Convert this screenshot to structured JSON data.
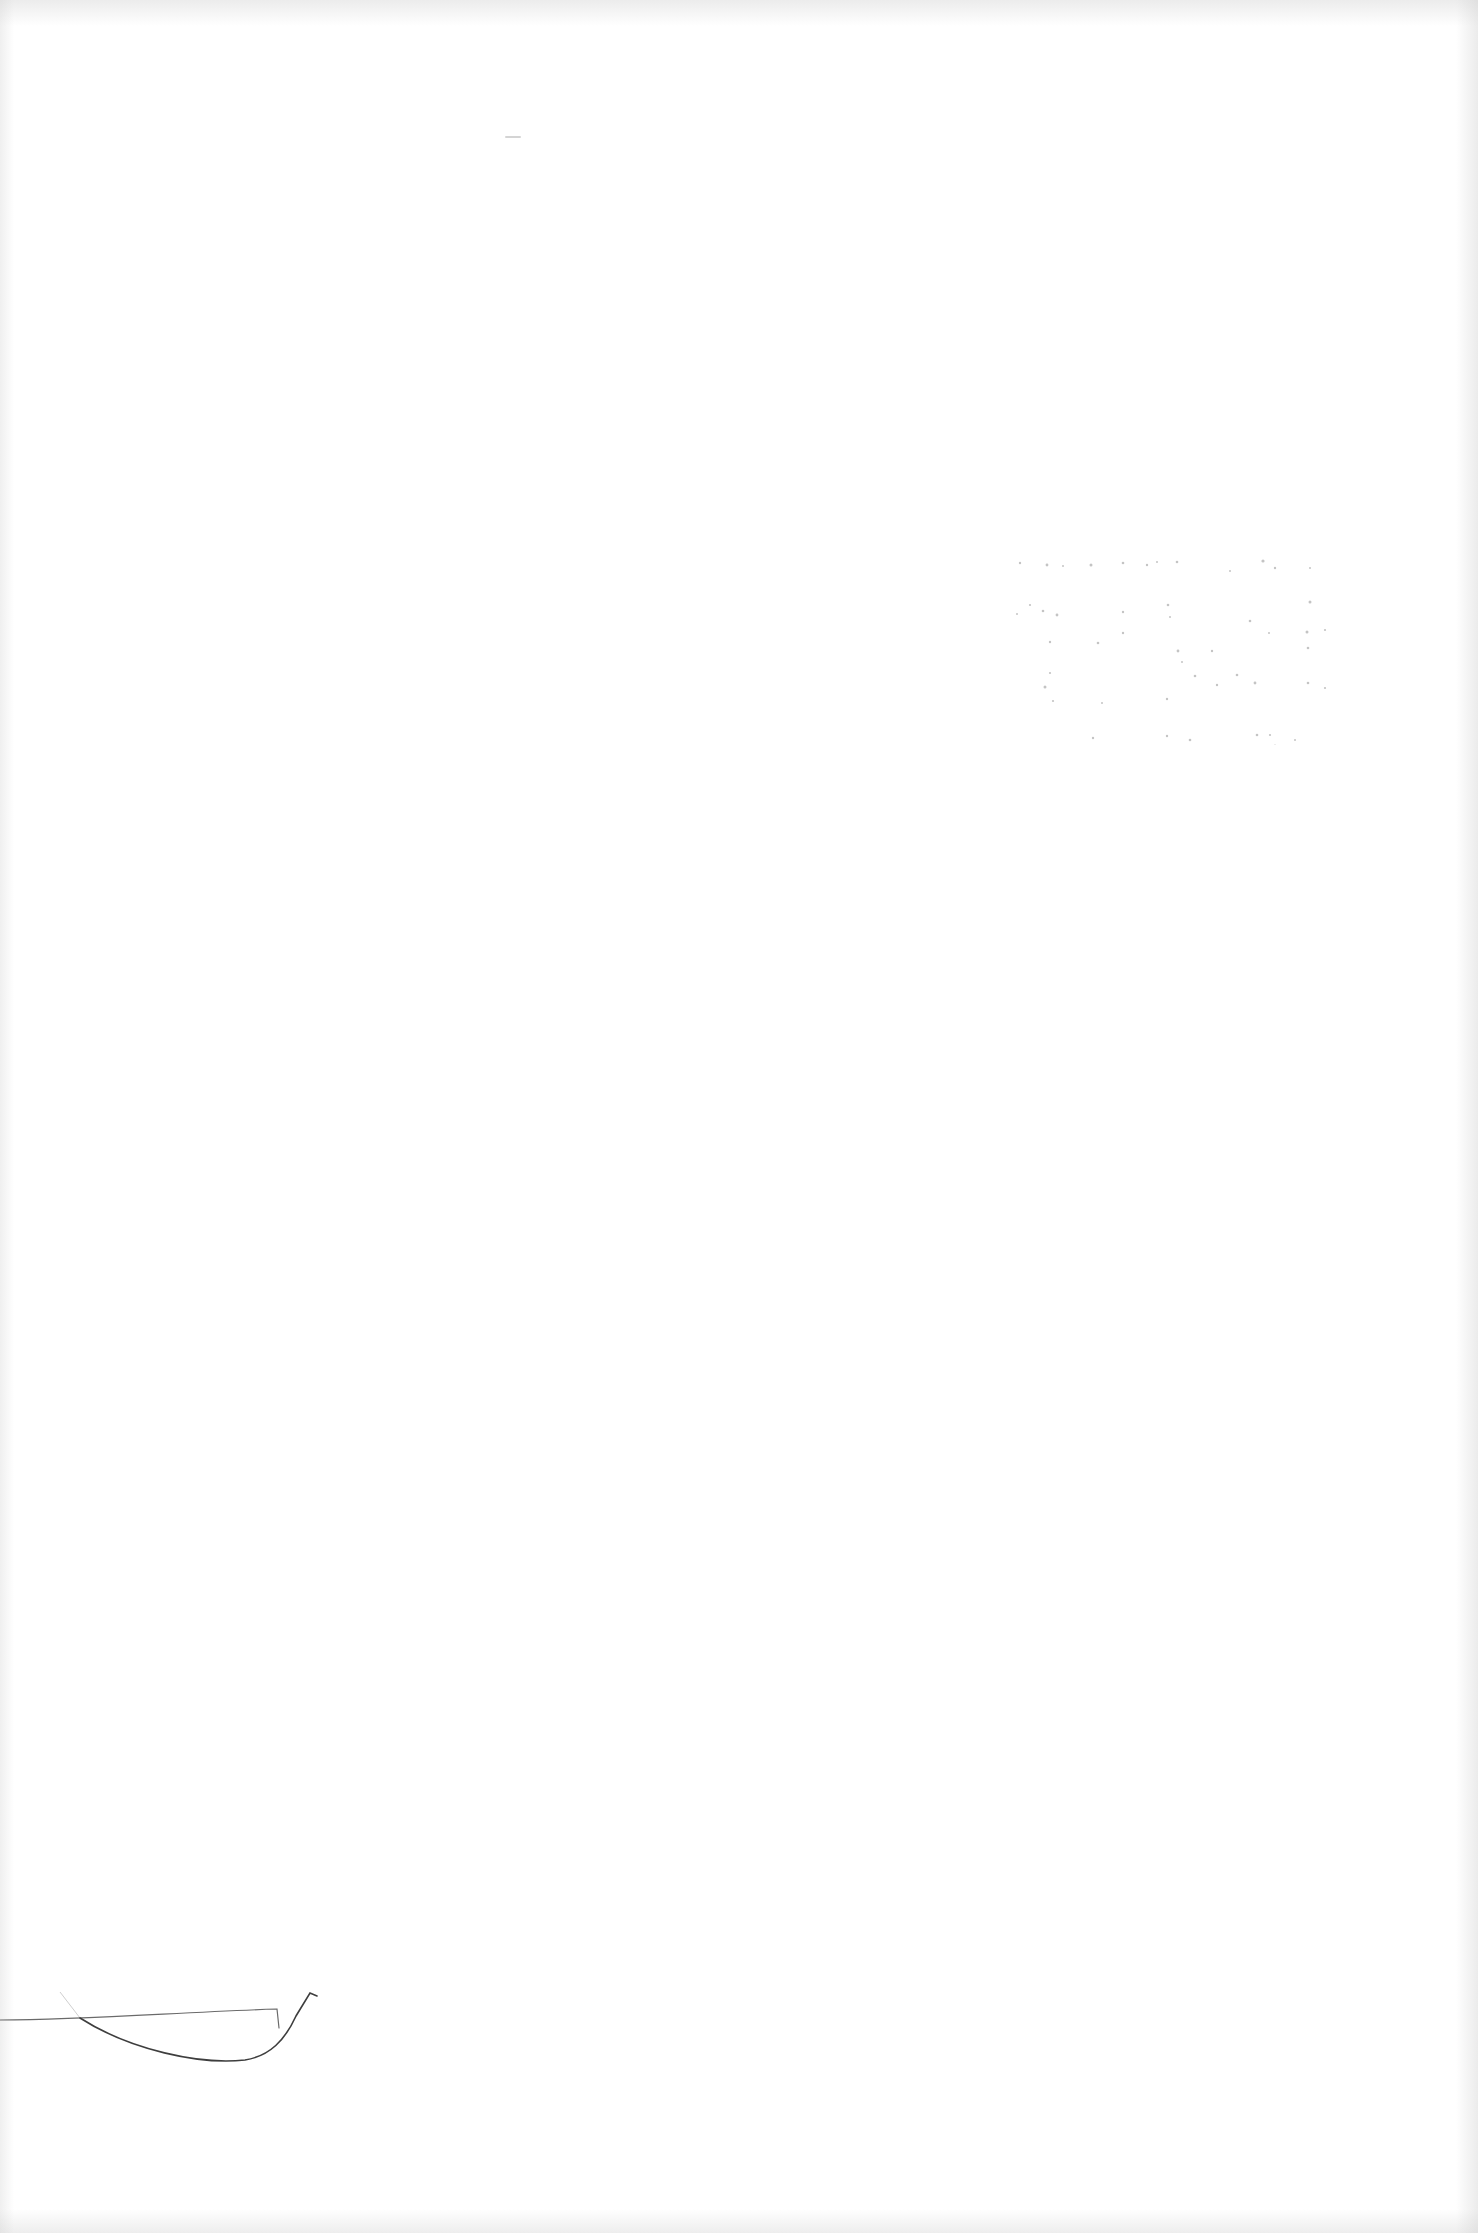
{
  "page": {
    "type": "blank scanned page",
    "background_color": "#ffffff",
    "text_content": []
  },
  "marks": {
    "bleed_through": {
      "description": "faint illegible speckles from reverse side",
      "color": "#c8c8c8"
    },
    "handwritten_stroke": {
      "description": "pen stroke / partial signature at lower left",
      "color": "#4a4a4a"
    }
  }
}
